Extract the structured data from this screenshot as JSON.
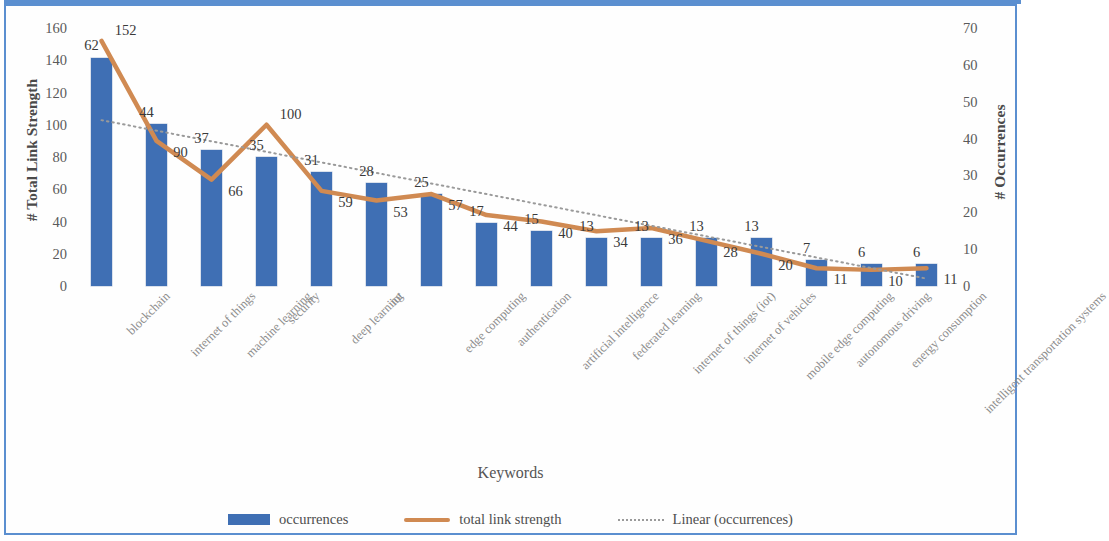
{
  "chart_data": {
    "type": "bar",
    "title": "",
    "xlabel": "Keywords",
    "ylabel": "# Total Link Strength",
    "y2label": "# Occurrences",
    "ylim": [
      0,
      160
    ],
    "y2lim": [
      0,
      70
    ],
    "yticks": [
      0,
      20,
      40,
      60,
      80,
      100,
      120,
      140,
      160
    ],
    "y2ticks": [
      0,
      10,
      20,
      30,
      40,
      50,
      60,
      70
    ],
    "grid": false,
    "legend_position": "bottom",
    "categories": [
      "blockchain",
      "internet of things",
      "machine learning",
      "security",
      "deep learning",
      "iot",
      "edge computing",
      "authentication",
      "artificial intelligence",
      "federated learning",
      "internet of things (iot)",
      "internet of vehicles",
      "mobile edge computing",
      "autonomous driving",
      "energy consumption",
      "intelligent transportation systems"
    ],
    "series": [
      {
        "name": "occurrences",
        "type": "bar",
        "axis": "right",
        "color": "#3f6fb4",
        "values": [
          62,
          44,
          37,
          35,
          31,
          28,
          25,
          17,
          15,
          13,
          13,
          13,
          13,
          7,
          6,
          6
        ]
      },
      {
        "name": "total link strength",
        "type": "line",
        "axis": "left",
        "color": "#d08a52",
        "values": [
          152,
          90,
          66,
          100,
          59,
          53,
          57,
          44,
          40,
          34,
          36,
          28,
          20,
          11,
          10,
          11
        ]
      },
      {
        "name": "Linear (occurrences)",
        "type": "trendline",
        "axis": "right",
        "color": "#9a9a9a",
        "style": "dotted",
        "start_value": 45,
        "end_value": 2
      }
    ]
  },
  "legend": {
    "items": [
      {
        "label": "occurrences",
        "marker": "bar-swatch"
      },
      {
        "label": "total link strength",
        "marker": "line-swatch"
      },
      {
        "label": "Linear (occurrences)",
        "marker": "dotted-swatch"
      }
    ]
  },
  "frame": {
    "border_color": "#5b8fd0"
  }
}
